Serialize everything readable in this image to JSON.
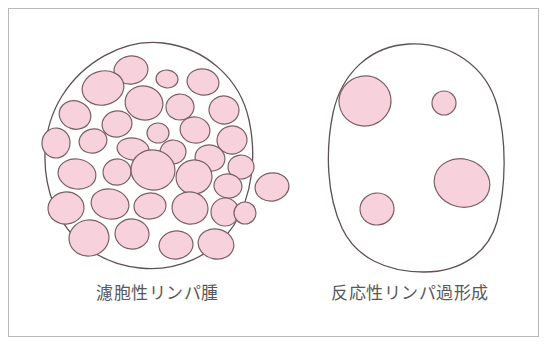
{
  "figure": {
    "type": "medical-illustration",
    "background_color": "#ffffff",
    "frame_color": "#b8b8b8",
    "outline_color": "#5e5056",
    "follicle_fill": "#f7d2dc",
    "follicle_stroke": "#7a6066",
    "caption_color": "#58585a"
  },
  "panels": [
    {
      "id": "follicular-lymphoma",
      "caption": "濾胞性リンパ腫",
      "node_outline": "M 163,43 C 205,48 240,78 249,120 C 257,157 252,196 234,225 C 214,256 176,272 140,268 C 100,264 68,240 54,205 C 40,170 42,128 62,96 C 82,64 122,38 163,43 Z",
      "follicle_count": 31,
      "follicles": [
        {
          "cx": 131,
          "cy": 70,
          "rx": 17,
          "ry": 14,
          "rot": -8
        },
        {
          "cx": 167,
          "cy": 79,
          "rx": 11,
          "ry": 9,
          "rot": 5
        },
        {
          "cx": 203,
          "cy": 82,
          "rx": 16,
          "ry": 13,
          "rot": 10
        },
        {
          "cx": 103,
          "cy": 88,
          "rx": 21,
          "ry": 17,
          "rot": -12
        },
        {
          "cx": 144,
          "cy": 103,
          "rx": 19,
          "ry": 17,
          "rot": 15
        },
        {
          "cx": 180,
          "cy": 107,
          "rx": 14,
          "ry": 13,
          "rot": -5
        },
        {
          "cx": 224,
          "cy": 110,
          "rx": 15,
          "ry": 14,
          "rot": 8
        },
        {
          "cx": 75,
          "cy": 115,
          "rx": 16,
          "ry": 14,
          "rot": 20
        },
        {
          "cx": 117,
          "cy": 124,
          "rx": 15,
          "ry": 13,
          "rot": -10
        },
        {
          "cx": 158,
          "cy": 133,
          "rx": 11,
          "ry": 10,
          "rot": 0
        },
        {
          "cx": 195,
          "cy": 130,
          "rx": 15,
          "ry": 13,
          "rot": 12
        },
        {
          "cx": 232,
          "cy": 140,
          "rx": 15,
          "ry": 14,
          "rot": -8
        },
        {
          "cx": 56,
          "cy": 143,
          "rx": 14,
          "ry": 15,
          "rot": 5
        },
        {
          "cx": 93,
          "cy": 141,
          "rx": 14,
          "ry": 12,
          "rot": -15
        },
        {
          "cx": 133,
          "cy": 149,
          "rx": 16,
          "ry": 11,
          "rot": 8
        },
        {
          "cx": 173,
          "cy": 152,
          "rx": 13,
          "ry": 12,
          "rot": -6
        },
        {
          "cx": 210,
          "cy": 158,
          "rx": 15,
          "ry": 13,
          "rot": 14
        },
        {
          "cx": 241,
          "cy": 167,
          "rx": 13,
          "ry": 12,
          "rot": -4
        },
        {
          "cx": 77,
          "cy": 174,
          "rx": 19,
          "ry": 15,
          "rot": 10
        },
        {
          "cx": 117,
          "cy": 172,
          "rx": 14,
          "ry": 13,
          "rot": -9
        },
        {
          "cx": 153,
          "cy": 170,
          "rx": 22,
          "ry": 20,
          "rot": 6
        },
        {
          "cx": 194,
          "cy": 177,
          "rx": 18,
          "ry": 17,
          "rot": -12
        },
        {
          "cx": 228,
          "cy": 186,
          "rx": 14,
          "ry": 12,
          "rot": 7
        },
        {
          "cx": 66,
          "cy": 208,
          "rx": 18,
          "ry": 16,
          "rot": -7
        },
        {
          "cx": 110,
          "cy": 204,
          "rx": 19,
          "ry": 15,
          "rot": 11
        },
        {
          "cx": 150,
          "cy": 206,
          "rx": 16,
          "ry": 13,
          "rot": -5
        },
        {
          "cx": 190,
          "cy": 208,
          "rx": 18,
          "ry": 16,
          "rot": 9
        },
        {
          "cx": 225,
          "cy": 212,
          "rx": 14,
          "ry": 14,
          "rot": 0
        },
        {
          "cx": 89,
          "cy": 238,
          "rx": 20,
          "ry": 18,
          "rot": -10
        },
        {
          "cx": 132,
          "cy": 234,
          "rx": 17,
          "ry": 15,
          "rot": 6
        },
        {
          "cx": 176,
          "cy": 245,
          "rx": 17,
          "ry": 14,
          "rot": -8
        },
        {
          "cx": 216,
          "cy": 244,
          "rx": 18,
          "ry": 15,
          "rot": 12
        }
      ],
      "escaping_follicles": [
        {
          "cx": 245,
          "cy": 213,
          "rx": 11,
          "ry": 11,
          "rot": 0,
          "note": "capsule-breach"
        },
        {
          "cx": 272,
          "cy": 187,
          "rx": 17,
          "ry": 14,
          "rot": -10,
          "note": "extranodal"
        }
      ]
    },
    {
      "id": "reactive-lymphoid-hyperplasia",
      "caption": "反応性リンパ過形成",
      "node_outline": "M 409,44 C 452,42 486,67 497,105 C 507,142 506,186 497,222 C 488,253 461,272 424,272 C 387,272 356,258 342,228 C 327,196 325,152 333,113 C 342,72 371,46 409,44 Z",
      "follicle_count": 4,
      "follicles": [
        {
          "cx": 365,
          "cy": 101,
          "rx": 26,
          "ry": 25,
          "rot": -10,
          "size": "large"
        },
        {
          "cx": 444,
          "cy": 103,
          "rx": 12,
          "ry": 12,
          "rot": 0,
          "size": "small"
        },
        {
          "cx": 462,
          "cy": 183,
          "rx": 28,
          "ry": 24,
          "rot": 14,
          "size": "large"
        },
        {
          "cx": 377,
          "cy": 209,
          "rx": 17,
          "ry": 16,
          "rot": -6,
          "size": "medium"
        }
      ]
    }
  ]
}
